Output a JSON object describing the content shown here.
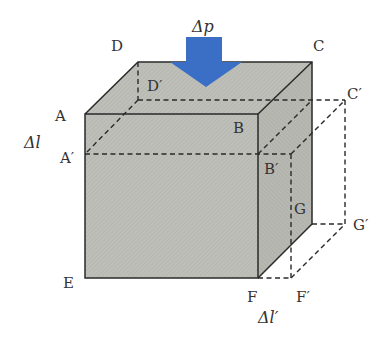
{
  "diagram": {
    "type": "bulk-modulus-cube-compression",
    "colors": {
      "face_fill": "#bdbdb7",
      "top_fill": "#c6c6c0",
      "side_fill": "#b3b3ad",
      "edge": "#2a2a2a",
      "dashed": "#2a2a2a",
      "arrow": "#3b6ec5"
    },
    "labels": {
      "A": "A",
      "B": "B",
      "C": "C",
      "D": "D",
      "E": "E",
      "F": "F",
      "G": "G",
      "A_prime": "A′",
      "B_prime": "B′",
      "C_prime": "C′",
      "D_prime": "D′",
      "F_prime": "F′",
      "G_prime": "G′",
      "delta_p": "Δp",
      "delta_l": "Δl",
      "delta_l_prime": "Δl′"
    }
  }
}
